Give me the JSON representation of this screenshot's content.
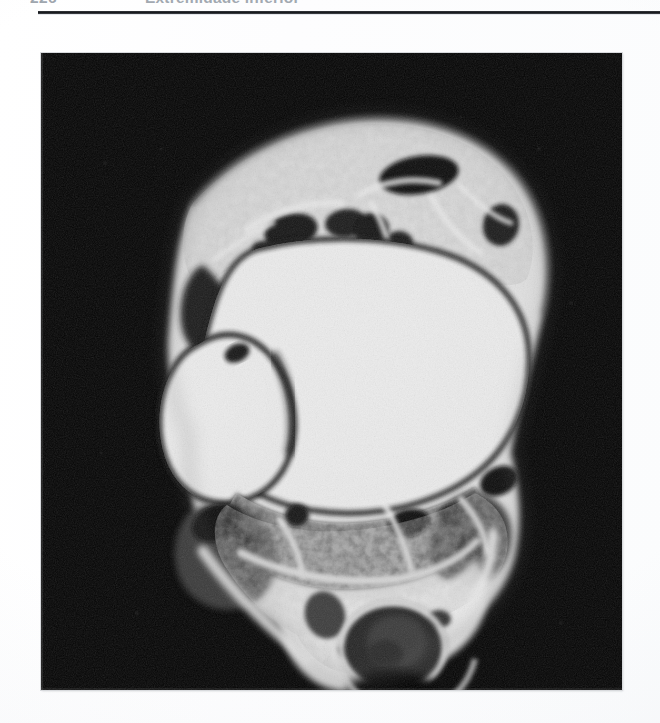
{
  "page": {
    "background_color": "#ffffff",
    "paper_tone_color": "#fbfcfd"
  },
  "header": {
    "folio": "226",
    "title": "Extremidade inferior",
    "text_color": "#a2a9b1",
    "rule_color": "#14161a"
  },
  "figure": {
    "background_color": "#050505",
    "border_color": "#d8dadd",
    "modality": "mri-axial-grayscale",
    "region": "tornozelo / retropé",
    "bounds_px": {
      "left": 41,
      "top": 53,
      "width": 581,
      "height": 637
    },
    "structures": [
      {
        "name": "talus-trabecular-bone",
        "signal": "hyperintense",
        "texture": "trabecular"
      },
      {
        "name": "medial-malleolus",
        "signal": "hyperintense",
        "texture": "trabecular"
      },
      {
        "name": "anterior-tendon-group",
        "signal": "hypointense"
      },
      {
        "name": "posterior-tibial-neurovascular-bundle",
        "signal": "hypointense"
      },
      {
        "name": "achilles-tendon",
        "signal": "hypointense"
      },
      {
        "name": "plantar-fat-pad",
        "signal": "intermediate"
      },
      {
        "name": "subcutaneous-fat",
        "signal": "hyperintense"
      },
      {
        "name": "flexor-hallucis-longus-tendon",
        "signal": "hypointense"
      }
    ]
  }
}
